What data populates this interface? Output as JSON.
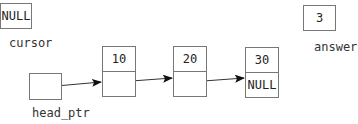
{
  "cursor": {
    "value": "NULL",
    "label": "cursor"
  },
  "answer": {
    "value": "3",
    "label": "answer"
  },
  "head_ptr": {
    "value": "",
    "label": "head_ptr"
  },
  "nodes": [
    {
      "data": "10",
      "link": ""
    },
    {
      "data": "20",
      "link": ""
    },
    {
      "data": "30",
      "link": "NULL"
    }
  ]
}
